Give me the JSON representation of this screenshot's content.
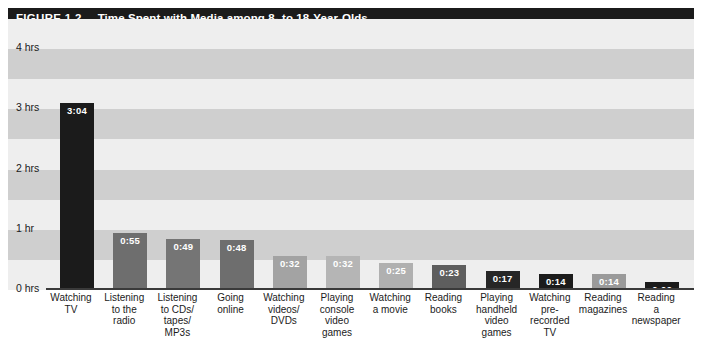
{
  "figure": {
    "number": "FIGURE 1.2",
    "title": "Time Spent with Media among 8- to 18-Year-Olds"
  },
  "chart_data": {
    "type": "bar",
    "title": "Time Spent with Media among 8- to 18-Year-Olds",
    "xlabel": "",
    "ylabel": "",
    "ylim": [
      0,
      4.25
    ],
    "grid": "horizontal-alternating-bands",
    "legend": "none",
    "y_unit": "hours:minutes",
    "ytick_labels": [
      "0 hrs",
      "1 hr",
      "2 hrs",
      "3 hrs",
      "4 hrs"
    ],
    "ytick_values": [
      0,
      1,
      2,
      3,
      4
    ],
    "categories": [
      "Watching TV",
      "Listening to the radio",
      "Listening to CDs/tapes/MP3s",
      "Going online",
      "Watching videos/DVDs",
      "Playing console video games",
      "Watching a movie",
      "Reading books",
      "Playing handheld video games",
      "Watching pre-recorded TV",
      "Reading magazines",
      "Reading a newspaper"
    ],
    "category_lines": [
      [
        "Watching",
        "TV"
      ],
      [
        "Listening",
        "to the",
        "radio"
      ],
      [
        "Listening",
        "to CDs/",
        "tapes/",
        "MP3s"
      ],
      [
        "Going",
        "online"
      ],
      [
        "Watching",
        "videos/",
        "DVDs"
      ],
      [
        "Playing",
        "console",
        "video",
        "games"
      ],
      [
        "Watching",
        "a movie"
      ],
      [
        "Reading",
        "books"
      ],
      [
        "Playing",
        "handheld",
        "video",
        "games"
      ],
      [
        "Watching",
        "pre-",
        "recorded",
        "TV"
      ],
      [
        "Reading",
        "magazines"
      ],
      [
        "Reading",
        "a",
        "newspaper"
      ]
    ],
    "value_labels": [
      "3:04",
      "0:55",
      "0:49",
      "0:48",
      "0:32",
      "0:32",
      "0:25",
      "0:23",
      "0:17",
      "0:14",
      "0:14",
      "0:06"
    ],
    "values": [
      3.0667,
      0.9167,
      0.8167,
      0.8,
      0.5333,
      0.5333,
      0.4167,
      0.3833,
      0.2833,
      0.2333,
      0.2333,
      0.1
    ],
    "bar_colors": [
      "#1b1b1b",
      "#6e6e6e",
      "#757575",
      "#6e6e6e",
      "#a3a3a3",
      "#b5b5b5",
      "#b0b0b0",
      "#5e5e5e",
      "#262626",
      "#1b1b1b",
      "#9a9a9a",
      "#1b1b1b"
    ]
  },
  "colors": {
    "banner": "#1b1b1b",
    "banner_text": "#ffffff",
    "band_light": "#eeeeee",
    "band_dark": "#cfcfcf",
    "axis": "#3a3a3a",
    "text": "#1b1b1b"
  }
}
